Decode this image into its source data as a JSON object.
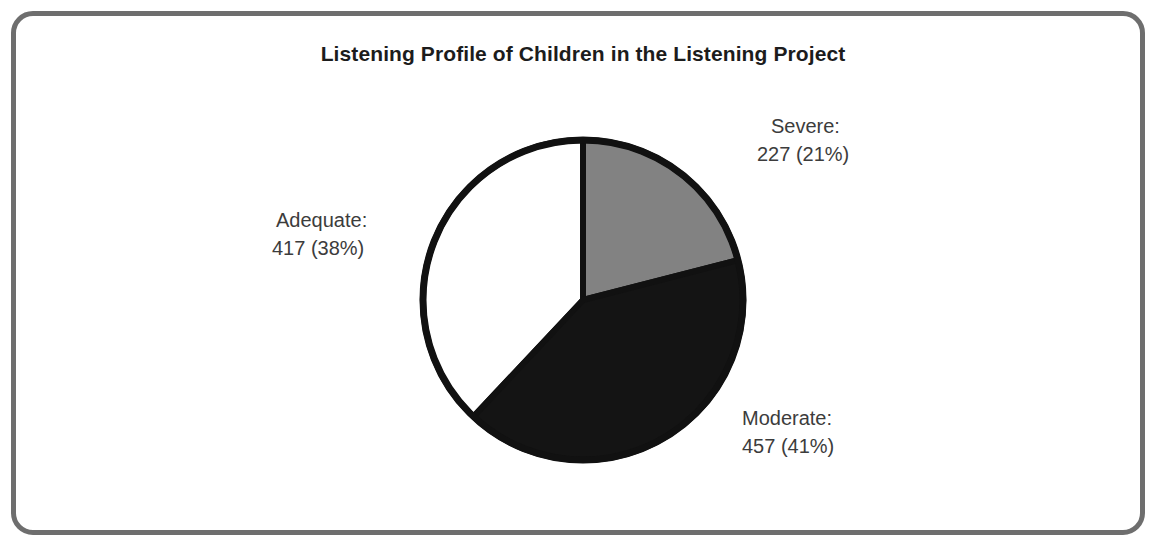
{
  "chart_data": {
    "type": "pie",
    "title": "Listening Profile of Children in the Listening Project",
    "categories": [
      "Severe",
      "Moderate",
      "Adequate"
    ],
    "values": [
      227,
      457,
      417
    ],
    "percentages": [
      21,
      41,
      38
    ],
    "total": 1101,
    "start_angle_deg": 0,
    "direction": "clockwise",
    "legend": "none",
    "grid": false,
    "slices": [
      {
        "name": "Severe",
        "label_name": "Severe:",
        "label_value": "227 (21%)",
        "count": 227,
        "percent": 21,
        "color": "#828282",
        "start_deg": 0,
        "end_deg": 75.6
      },
      {
        "name": "Moderate",
        "label_name": "Moderate:",
        "label_value": "457 (41%)",
        "count": 457,
        "percent": 41,
        "color": "#141414",
        "start_deg": 75.6,
        "end_deg": 223.2
      },
      {
        "name": "Adequate",
        "label_name": "Adequate:",
        "label_value": "417 (38%)",
        "count": 417,
        "percent": 38,
        "color": "#ffffff",
        "start_deg": 223.2,
        "end_deg": 360
      }
    ]
  },
  "figure": {
    "title": "Listening Profile of Children in the Listening Project",
    "background_color": "#ffffff",
    "frame_color": "#6e6e6e",
    "outline_color": "#111111",
    "label_text_color": "#3c3c3c"
  }
}
